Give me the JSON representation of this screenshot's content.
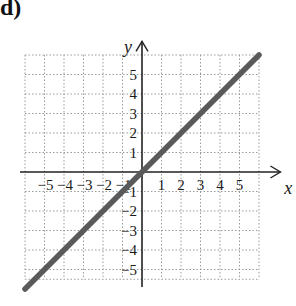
{
  "panel_label": "d)",
  "chart_data": {
    "type": "line",
    "title": "",
    "xlabel": "x",
    "ylabel": "y",
    "xlim": [
      -6,
      6
    ],
    "ylim": [
      -6,
      6
    ],
    "grid": true,
    "grid_style": "dotted",
    "x_ticks": [
      -5,
      -4,
      -3,
      -2,
      -1,
      1,
      2,
      3,
      4,
      5
    ],
    "y_ticks": [
      -5,
      -4,
      -3,
      -2,
      -1,
      1,
      2,
      3,
      4,
      5
    ],
    "x_tick_labels": [
      "−5",
      "−4",
      "−3",
      "−2",
      "−1",
      "1",
      "2",
      "3",
      "4",
      "5"
    ],
    "y_tick_labels": [
      "−5",
      "−4",
      "−3",
      "−2",
      "−1",
      "1",
      "2",
      "3",
      "4",
      "5"
    ],
    "series": [
      {
        "name": "y = x",
        "x": [
          -6,
          6
        ],
        "y": [
          -6,
          6
        ],
        "color": "#5a5a5a"
      }
    ]
  }
}
